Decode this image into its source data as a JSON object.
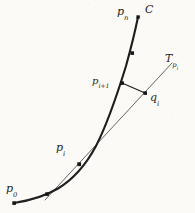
{
  "figure": {
    "kind": "geometry-diagram",
    "background_color": "#fbfaf7",
    "ink_color": "#1d1d1d"
  },
  "labels": {
    "curve": "C",
    "p_zero": {
      "base": "p",
      "sub": "0"
    },
    "p_i": {
      "base": "p",
      "sub": "i"
    },
    "p_i_plus_1": {
      "base": "p",
      "sub": "i+1"
    },
    "p_n": {
      "base": "p",
      "sub": "n"
    },
    "q_i": {
      "base": "q",
      "sub": "i"
    },
    "tangent": {
      "base": "T",
      "sub": "p",
      "subsub": "i"
    }
  },
  "diagram_data": {
    "type": "diagram",
    "viewbox": [
      0,
      0,
      195,
      213
    ],
    "curve": {
      "name": "C",
      "stroke": "#1d1d1d",
      "stroke_width": 2.1,
      "path": "M 14,203 C 30,200 44,196 58,188 C 72,180 84,168 96,146 C 108,122 118,92 126,66 C 131,48 135,30 138,17"
    },
    "tangent_line": {
      "name": "T_{p_i}",
      "stroke": "#4a4a48",
      "stroke_width": 0.8,
      "from": [
        45,
        200
      ],
      "to": [
        172,
        63
      ],
      "through_point": "p_i"
    },
    "chord_segment": {
      "name": "p_{i+1} to q_i",
      "stroke": "#1d1d1d",
      "stroke_width": 1.1,
      "from": [
        122,
        83
      ],
      "to": [
        145,
        93
      ]
    },
    "points": [
      {
        "id": "p_0",
        "label": "p0",
        "x": 14,
        "y": 203,
        "on": "curve"
      },
      {
        "id": "p_mid",
        "label": "",
        "x": 47,
        "y": 194,
        "on": "curve"
      },
      {
        "id": "p_i",
        "label": "pi",
        "x": 79,
        "y": 164,
        "on": "curve"
      },
      {
        "id": "p_i+1",
        "label": "pi+1",
        "x": 122,
        "y": 83,
        "on": "curve"
      },
      {
        "id": "p_k",
        "label": "",
        "x": 132,
        "y": 53,
        "on": "curve"
      },
      {
        "id": "p_n",
        "label": "pn",
        "x": 138,
        "y": 17,
        "on": "curve"
      },
      {
        "id": "q_i",
        "label": "qi",
        "x": 145,
        "y": 93,
        "on": "tangent_line"
      }
    ],
    "marker_style": {
      "shape": "square",
      "size": 3.4,
      "fill": "#161616"
    }
  }
}
